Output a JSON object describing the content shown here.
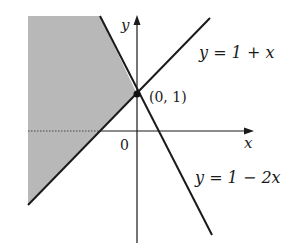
{
  "figure": {
    "type": "inequality-region-graph",
    "axes": {
      "x_label": "x",
      "y_label": "y",
      "origin_label": "0"
    },
    "lines": [
      {
        "name": "line-y-1-plus-x",
        "equation": "y = 1 + x",
        "slope": 1,
        "intercept": 1
      },
      {
        "name": "line-y-1-minus-2x",
        "equation": "y = 1 − 2x",
        "slope": -2,
        "intercept": 1
      }
    ],
    "intersection": {
      "label": "(0, 1)",
      "x": 0,
      "y": 1
    },
    "shaded_region": {
      "description": "region left of y = 1 − 2x and above y = 1 + x boundary, x < 0",
      "color": "#b8b8b8"
    },
    "colors": {
      "line": "#1a1a1a",
      "shade": "#b8b8b8"
    }
  }
}
